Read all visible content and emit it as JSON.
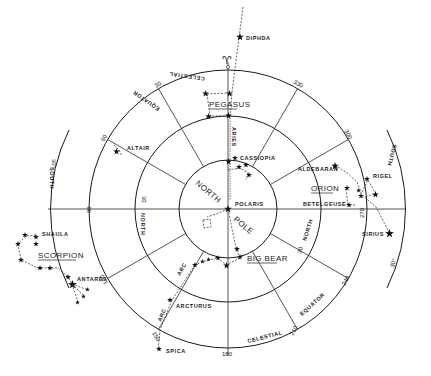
{
  "diagram": {
    "type": "polar star chart",
    "center_label_north": "NORTH",
    "center_label_pole": "POLE",
    "ring_labels": {
      "celestial_equator": [
        "CELESTIAL",
        "EQUATOR"
      ],
      "north_30": "30 NORTH",
      "south_30": "30° SOUTH"
    },
    "hour_ticks": [
      "30",
      "60",
      "90",
      "120",
      "150",
      "180",
      "210",
      "240",
      "270",
      "300",
      "330"
    ],
    "aries_symbol": "♈",
    "aries_label": "ARIES",
    "arc_label": "ARC"
  },
  "constellations": [
    {
      "name": "PEGASUS"
    },
    {
      "name": "ORION"
    },
    {
      "name": "BIG BEAR"
    },
    {
      "name": "SCORPION"
    }
  ],
  "stars": [
    {
      "name": "DIPHDA"
    },
    {
      "name": "ALTAIR"
    },
    {
      "name": "CASSIOPIA"
    },
    {
      "name": "POLARIS"
    },
    {
      "name": "ALDEBARAN"
    },
    {
      "name": "RIGEL"
    },
    {
      "name": "BETELGEUSE"
    },
    {
      "name": "SIRIUS"
    },
    {
      "name": "SHAULA"
    },
    {
      "name": "ANTARES"
    },
    {
      "name": "ARCTURUS"
    },
    {
      "name": "SPICA"
    }
  ],
  "text": {
    "celestial_top": "CELESTIAL",
    "equator_top": "EQUATOR",
    "celestial_bottom": "CELESTIAL",
    "equator_bottom": "EQUATOR",
    "north_left": "NORTH",
    "north_right": "NORTH",
    "thirty_left": "30",
    "thirty_right": "30",
    "south_left": "SOUTH",
    "south_right": "SOUTH",
    "deg30_left": "30°",
    "deg30_right": "30°",
    "deg30_right_bottom": "30°"
  }
}
